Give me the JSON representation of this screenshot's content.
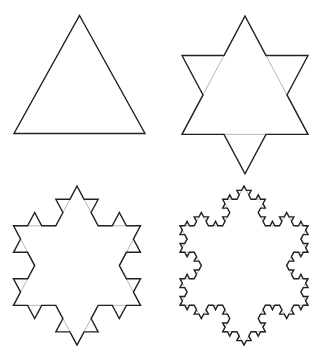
{
  "colors": {
    "background": "#ffffff",
    "stroke": "#222222",
    "ghost_stroke": "#b8b8b8"
  },
  "figures": [
    {
      "name": "iteration-0",
      "label": "Iteration 0",
      "depth": 0,
      "cx": 79.5,
      "top": 15.5,
      "side": 131,
      "scale_y": 1.04
    },
    {
      "name": "iteration-1",
      "label": "Iteration 1",
      "depth": 1,
      "cx": 245,
      "top": 16,
      "side": 126,
      "scale_y": 1.085
    },
    {
      "name": "iteration-2",
      "label": "Iteration 2",
      "depth": 2,
      "cx": 77,
      "top": 186,
      "side": 127,
      "scale_y": 1.085
    },
    {
      "name": "iteration-3",
      "label": "Iteration 3",
      "depth": 3,
      "cx": 244,
      "top": 186,
      "side": 128,
      "scale_y": 1.076
    }
  ]
}
